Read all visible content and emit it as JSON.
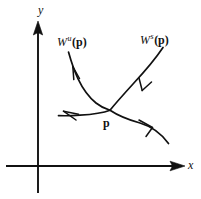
{
  "figure": {
    "background_color": "#ffffff",
    "ink_color": "#111111",
    "axes": {
      "x_label": "x",
      "y_label": "y",
      "origin": [
        38,
        166
      ],
      "x_axis": {
        "from": [
          6,
          166
        ],
        "to": [
          185,
          166
        ],
        "arrow": "right"
      },
      "y_axis": {
        "from": [
          38,
          193
        ],
        "to": [
          38,
          22
        ],
        "arrow": "up"
      }
    },
    "labels": {
      "unstable": {
        "w": "W",
        "sup": "u",
        "point": "(p)"
      },
      "stable": {
        "w": "W",
        "sup": "s",
        "point": "(p)"
      },
      "saddle_point": "p"
    },
    "saddle_point_position": [
      110,
      110
    ],
    "curves": [
      {
        "name": "unstable-manifold",
        "label": "W u (p)",
        "kind": "unstable",
        "description": "branch from upper-left down to saddle point and continuing to lower-left",
        "path": "M 68 52 C 74 70, 82 92, 110 110 C 118 113, 100 114, 58 116",
        "arrows": [
          {
            "at": [
              74,
              72
            ],
            "direction": "up-left",
            "flow": "away-from-p"
          },
          {
            "at": [
              72,
              114
            ],
            "direction": "left",
            "flow": "away-from-p"
          }
        ]
      },
      {
        "name": "stable-manifold",
        "label": "W s (p)",
        "kind": "stable",
        "description": "branch from upper-right down to saddle point and continuing to lower-right",
        "path": "M 162 48 C 150 66, 126 88, 110 110 C 124 124, 142 126, 168 143",
        "arrows": [
          {
            "at": [
              145,
              68
            ],
            "direction": "down-left",
            "flow": "toward-p"
          },
          {
            "at": [
              148,
              128
            ],
            "direction": "left-down",
            "flow": "toward-p"
          }
        ]
      }
    ]
  }
}
